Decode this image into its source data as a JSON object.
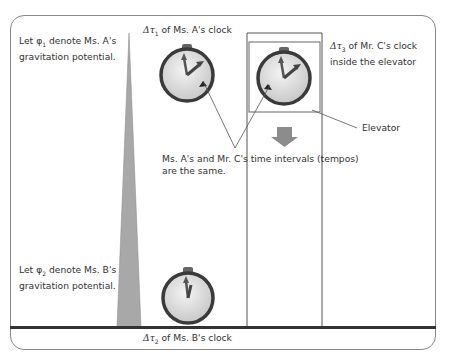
{
  "labels": {
    "phi1_line1": "Let φ",
    "phi1_sub": "1",
    "phi1_rest": " denote Ms. A's",
    "phi1_line2": "gravitation potential.",
    "phi2_line1": "Let φ",
    "phi2_sub": "2",
    "phi2_rest": " denote Ms. B's",
    "phi2_line2": "gravitation potential.",
    "tau1_sym": "Δτ",
    "tau1_sub": "1",
    "tau1_text": " of Ms. A's clock",
    "tau3_sym": "Δτ",
    "tau3_sub": "3",
    "tau3_text": " of Mr. C's clock",
    "tau3_line2": "inside the elevator",
    "tau2_sym": "Δτ",
    "tau2_sub": "2",
    "tau2_text": " of Ms. B's clock",
    "elevator": "Elevator",
    "same_line1": "Ms. A's and Mr. C's time intervals (tempos)",
    "same_line2": "are the same."
  },
  "colors": {
    "ground": "#333333",
    "potential_wedge": "#a8a8a8",
    "clock_rim": "#3a3a3a",
    "clock_face": "#e4e4e4",
    "arrow_down": "#8c8c8c"
  }
}
